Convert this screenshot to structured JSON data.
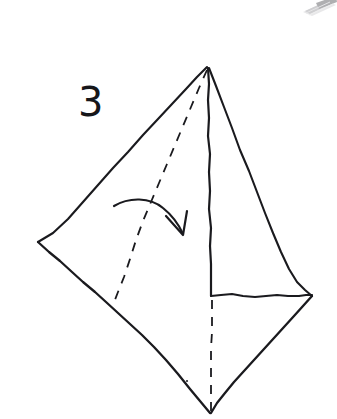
{
  "page": {
    "background_color": "#ffffff",
    "ink_color": "#1a1a1e",
    "width": 337,
    "height": 419
  },
  "label": {
    "step_number": "3"
  },
  "figure": {
    "name": "folded-paper-kite-shape",
    "vertices": {
      "apex": [
        207,
        67
      ],
      "left": [
        38,
        242
      ],
      "right": [
        312,
        296
      ],
      "bottom": [
        210,
        413
      ]
    },
    "solid_lines": [
      {
        "name": "upper-left-edge",
        "points": "207,67 178,96 150,124 120,155 92,184 64,214 38,242"
      },
      {
        "name": "upper-right-edge",
        "points": "209,68 229,112 250,157 270,200 289,243 303,273 312,296"
      },
      {
        "name": "lower-left-edge",
        "points": "38,242 66,266 95,292 124,318 152,345 181,377 210,413"
      },
      {
        "name": "lower-right-edge",
        "points": "312,296 292,320 272,342 252,364 232,386 211,413"
      },
      {
        "name": "centre-crease-vertical",
        "points": "208,68 209,100 208,135 210,175 209,215 211,255 211,296"
      },
      {
        "name": "horizontal-edge",
        "points": "211,296 232,294 255,297 278,295 298,296 312,295"
      }
    ],
    "dashed_lines": [
      {
        "name": "diagonal-fold-line",
        "points": "207,69 190,108 172,148 154,188 136,228 124,267 113,305"
      },
      {
        "name": "vertical-fold-line",
        "points": "212,300 212,330 211,360 211,390 211,413"
      }
    ],
    "arrow": {
      "name": "fold-direction-arrow",
      "curve": "M115,206 C136,196 166,204 182,232",
      "head": "168,217 183,235 186,211"
    },
    "ink_speck": {
      "x": 187,
      "y": 381
    }
  },
  "artifacts": {
    "corner_scan_mark": {
      "name": "scanner-edge-artifact",
      "position": "top-right",
      "color": "#b9b9bb"
    }
  }
}
